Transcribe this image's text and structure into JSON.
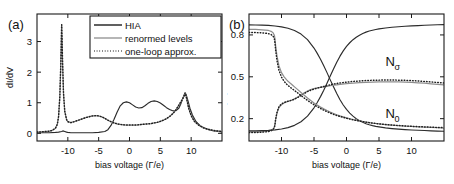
{
  "figure": {
    "panel_a_tag": "(a)",
    "panel_b_tag": "(b)"
  },
  "legend": {
    "position": "top-center-right",
    "items": [
      {
        "label": "HIA",
        "style": "solid",
        "color": "#2b2b2b"
      },
      {
        "label": "renormed levels",
        "style": "thin-solid",
        "color": "#8e8e8e"
      },
      {
        "label": "one-loop approx.",
        "style": "dotted",
        "color": "#1f1f1f"
      }
    ]
  },
  "chart_data": [
    {
      "type": "line",
      "panel": "(a)",
      "title": "",
      "xlabel": "bias voltage (Γ/e)",
      "ylabel": "dI/dV",
      "xlim": [
        -15,
        15
      ],
      "ylim": [
        -0.25,
        3.9
      ],
      "xticks": [
        -10,
        -5,
        0,
        5,
        10
      ],
      "xticklabels": [
        "-10",
        "-5",
        "0",
        "5",
        "10"
      ],
      "yticks": [
        0,
        1,
        2,
        3
      ],
      "yticklabels": [
        "0",
        "1",
        "2",
        "3"
      ],
      "grid": false,
      "series": [
        {
          "name": "HIA",
          "style": "solid",
          "color": "#2b2b2b",
          "x": [
            -15,
            -14,
            -13,
            -12,
            -11.5,
            -11,
            -10.8,
            -10.5,
            -10.2,
            -10,
            -9.5,
            -9,
            -8,
            -7,
            -6,
            -5,
            -4,
            -3.5,
            -3,
            -2.5,
            -2,
            -1.5,
            -1,
            -0.5,
            0,
            0.5,
            1,
            1.5,
            2,
            2.5,
            3,
            3.5,
            4,
            4.5,
            5,
            5.5,
            6,
            6.5,
            7,
            7.5,
            8,
            8.3,
            8.6,
            8.9,
            9,
            9.2,
            9.5,
            9.8,
            10.2,
            10.8,
            11.5,
            12.5,
            13.5,
            15
          ],
          "y": [
            0.02,
            0.02,
            0.02,
            0.03,
            0.04,
            0.06,
            0.08,
            0.06,
            0.04,
            0.03,
            0.02,
            0.02,
            0.02,
            0.02,
            0.02,
            0.03,
            0.06,
            0.12,
            0.26,
            0.46,
            0.7,
            0.9,
            1.0,
            1.03,
            1.0,
            0.93,
            0.86,
            0.83,
            0.84,
            0.9,
            0.98,
            1.04,
            1.06,
            1.04,
            0.99,
            0.92,
            0.84,
            0.78,
            0.74,
            0.74,
            0.82,
            0.95,
            1.12,
            1.28,
            1.33,
            1.26,
            1.05,
            0.82,
            0.6,
            0.38,
            0.24,
            0.14,
            0.09,
            0.05
          ]
        },
        {
          "name": "renormed levels",
          "style": "thin-solid",
          "color": "#8e8e8e",
          "x": [
            -15,
            -13,
            -12.5,
            -12,
            -11.7,
            -11.5,
            -11.3,
            -11.15,
            -11.05,
            -11,
            -10.95,
            -10.85,
            -10.7,
            -10.5,
            -10.2,
            -10,
            -9.5,
            -9,
            -8,
            -7,
            -6,
            -5.5,
            -5,
            -4.5,
            -4,
            -3.5,
            -3,
            -2.5,
            -2,
            -1.5,
            -1,
            -0.5,
            0,
            0.5,
            1,
            1.5,
            2,
            2.5,
            3,
            3.5,
            4,
            4.5,
            5,
            5.5,
            6,
            6.5,
            7,
            7.5,
            8,
            8.3,
            8.6,
            8.8,
            8.95,
            9.05,
            9.15,
            9.3,
            9.6,
            10,
            10.5,
            11.2,
            12,
            13,
            14,
            15
          ],
          "y": [
            0.04,
            0.07,
            0.1,
            0.17,
            0.3,
            0.55,
            1.2,
            2.2,
            3.1,
            3.55,
            3.2,
            2.3,
            1.3,
            0.72,
            0.45,
            0.38,
            0.35,
            0.38,
            0.45,
            0.52,
            0.57,
            0.58,
            0.57,
            0.54,
            0.49,
            0.43,
            0.38,
            0.34,
            0.31,
            0.29,
            0.28,
            0.27,
            0.27,
            0.27,
            0.27,
            0.28,
            0.29,
            0.3,
            0.31,
            0.32,
            0.34,
            0.36,
            0.39,
            0.43,
            0.48,
            0.55,
            0.64,
            0.76,
            0.92,
            1.02,
            1.12,
            1.2,
            1.26,
            1.28,
            1.24,
            1.1,
            0.82,
            0.58,
            0.4,
            0.27,
            0.18,
            0.12,
            0.08,
            0.06
          ]
        },
        {
          "name": "one-loop approx.",
          "style": "dotted",
          "color": "#1f1f1f",
          "x": [
            -15,
            -13,
            -12.5,
            -12,
            -11.7,
            -11.5,
            -11.3,
            -11.15,
            -11.05,
            -11,
            -10.95,
            -10.85,
            -10.7,
            -10.5,
            -10.2,
            -10,
            -9.5,
            -9,
            -8,
            -7,
            -6,
            -5.5,
            -5,
            -4.5,
            -4,
            -3.5,
            -3,
            -2.5,
            -2,
            -1.5,
            -1,
            -0.5,
            0,
            0.5,
            1,
            1.5,
            2,
            2.5,
            3,
            3.5,
            4,
            4.5,
            5,
            5.5,
            6,
            6.5,
            7,
            7.5,
            8,
            8.3,
            8.6,
            8.8,
            8.95,
            9.05,
            9.15,
            9.3,
            9.6,
            10,
            10.5,
            11.2,
            12,
            13,
            14,
            15
          ],
          "y": [
            0.04,
            0.07,
            0.1,
            0.17,
            0.3,
            0.55,
            1.2,
            2.2,
            3.1,
            3.55,
            3.2,
            2.3,
            1.3,
            0.72,
            0.45,
            0.38,
            0.35,
            0.38,
            0.45,
            0.52,
            0.57,
            0.58,
            0.57,
            0.54,
            0.49,
            0.43,
            0.38,
            0.34,
            0.31,
            0.29,
            0.28,
            0.27,
            0.27,
            0.27,
            0.27,
            0.28,
            0.29,
            0.3,
            0.31,
            0.32,
            0.34,
            0.36,
            0.39,
            0.43,
            0.48,
            0.55,
            0.64,
            0.76,
            0.92,
            1.02,
            1.12,
            1.2,
            1.26,
            1.28,
            1.24,
            1.1,
            0.82,
            0.58,
            0.4,
            0.27,
            0.18,
            0.12,
            0.08,
            0.06
          ]
        }
      ]
    },
    {
      "type": "line",
      "panel": "(b)",
      "title": "",
      "xlabel": "bias voltage (Γ/e)",
      "ylabel": "pop. numbers",
      "xlim": [
        -15,
        15
      ],
      "ylim": [
        0.04,
        0.95
      ],
      "xticks": [
        -10,
        -5,
        0,
        5,
        10
      ],
      "xticklabels": [
        "-10",
        "-5",
        "0",
        "5",
        "10"
      ],
      "yticks": [
        0.2,
        0.5,
        0.8
      ],
      "yticklabels": [
        "0.2",
        "0.5",
        "0.8"
      ],
      "grid": false,
      "annotations": [
        {
          "text": "N",
          "sub": "σ",
          "x": 6.0,
          "y": 0.575
        },
        {
          "text": "N",
          "sub": "0",
          "x": 6.0,
          "y": 0.205
        }
      ],
      "series": [
        {
          "name": "N_sigma HIA",
          "style": "solid",
          "color": "#2b2b2b",
          "x": [
            -15,
            -14,
            -13,
            -12,
            -11,
            -10,
            -9,
            -8,
            -7,
            -6,
            -5,
            -4.5,
            -4,
            -3.5,
            -3,
            -2.5,
            -2,
            -1.5,
            -1,
            -0.5,
            0,
            0.5,
            1,
            1.5,
            2,
            2.5,
            3,
            3.5,
            4,
            4.5,
            5,
            6,
            7,
            8,
            9,
            10,
            11,
            12,
            13,
            14,
            15
          ],
          "y": [
            0.872,
            0.871,
            0.87,
            0.868,
            0.864,
            0.858,
            0.848,
            0.832,
            0.806,
            0.766,
            0.706,
            0.668,
            0.626,
            0.58,
            0.53,
            0.478,
            0.428,
            0.38,
            0.336,
            0.298,
            0.266,
            0.24,
            0.218,
            0.2,
            0.186,
            0.174,
            0.164,
            0.156,
            0.15,
            0.145,
            0.141,
            0.134,
            0.129,
            0.125,
            0.122,
            0.119,
            0.117,
            0.115,
            0.113,
            0.111,
            0.11
          ]
        },
        {
          "name": "N_sigma renorm",
          "style": "thin-solid",
          "color": "#8e8e8e",
          "x": [
            -15,
            -14,
            -13,
            -12.5,
            -12,
            -11.6,
            -11.3,
            -11.1,
            -11,
            -10.9,
            -10.7,
            -10.4,
            -10,
            -9.6,
            -9.2,
            -9,
            -8.6,
            -8.2,
            -8,
            -7.5,
            -7,
            -6.5,
            -6,
            -5.5,
            -5,
            -4.5,
            -4,
            -3.5,
            -3,
            -2.5,
            -2,
            -1.5,
            -1,
            0,
            1,
            2,
            3,
            4,
            5,
            6,
            7,
            8,
            9,
            10,
            11,
            12,
            13,
            14,
            15
          ],
          "y": [
            0.105,
            0.106,
            0.108,
            0.11,
            0.113,
            0.118,
            0.126,
            0.14,
            0.16,
            0.195,
            0.24,
            0.28,
            0.3,
            0.312,
            0.32,
            0.324,
            0.33,
            0.337,
            0.342,
            0.355,
            0.37,
            0.385,
            0.398,
            0.408,
            0.415,
            0.42,
            0.424,
            0.428,
            0.432,
            0.436,
            0.44,
            0.443,
            0.446,
            0.451,
            0.455,
            0.458,
            0.46,
            0.462,
            0.463,
            0.464,
            0.464,
            0.463,
            0.462,
            0.46,
            0.457,
            0.454,
            0.45,
            0.446,
            0.443
          ]
        },
        {
          "name": "N_sigma one-loop",
          "style": "dotted",
          "color": "#1f1f1f",
          "x": [
            -15,
            -14,
            -13,
            -12.5,
            -12,
            -11.6,
            -11.3,
            -11.1,
            -11,
            -10.9,
            -10.7,
            -10.4,
            -10,
            -9.6,
            -9.2,
            -9,
            -8.6,
            -8.2,
            -8,
            -7.5,
            -7,
            -6.5,
            -6,
            -5.5,
            -5,
            -4.5,
            -4,
            -3.5,
            -3,
            -2.5,
            -2,
            -1.5,
            -1,
            0,
            1,
            2,
            3,
            4,
            5,
            6,
            7,
            8,
            9,
            10,
            11,
            12,
            13,
            14,
            15
          ],
          "y": [
            0.1,
            0.101,
            0.103,
            0.105,
            0.108,
            0.113,
            0.121,
            0.136,
            0.158,
            0.196,
            0.244,
            0.286,
            0.306,
            0.316,
            0.322,
            0.325,
            0.33,
            0.336,
            0.34,
            0.352,
            0.366,
            0.38,
            0.394,
            0.404,
            0.412,
            0.419,
            0.425,
            0.431,
            0.437,
            0.443,
            0.448,
            0.452,
            0.456,
            0.462,
            0.467,
            0.47,
            0.473,
            0.475,
            0.476,
            0.477,
            0.477,
            0.476,
            0.475,
            0.473,
            0.47,
            0.467,
            0.463,
            0.459,
            0.456
          ]
        },
        {
          "name": "N_0 HIA",
          "style": "solid",
          "color": "#2b2b2b",
          "x": [
            -15,
            -14,
            -13,
            -12,
            -11,
            -10,
            -9,
            -8,
            -7,
            -6,
            -5,
            -4.5,
            -4,
            -3.5,
            -3,
            -2.5,
            -2,
            -1.5,
            -1,
            -0.5,
            0,
            0.5,
            1,
            1.5,
            2,
            2.5,
            3,
            3.5,
            4,
            4.5,
            5,
            6,
            7,
            8,
            9,
            10,
            11,
            12,
            13,
            14,
            15
          ],
          "y": [
            0.112,
            0.113,
            0.114,
            0.116,
            0.12,
            0.126,
            0.136,
            0.152,
            0.178,
            0.218,
            0.278,
            0.316,
            0.358,
            0.404,
            0.454,
            0.506,
            0.556,
            0.604,
            0.648,
            0.686,
            0.718,
            0.744,
            0.766,
            0.784,
            0.798,
            0.81,
            0.82,
            0.828,
            0.834,
            0.839,
            0.843,
            0.85,
            0.855,
            0.859,
            0.862,
            0.865,
            0.867,
            0.869,
            0.871,
            0.873,
            0.874
          ]
        },
        {
          "name": "N_0 renorm",
          "style": "thin-solid",
          "color": "#8e8e8e",
          "x": [
            -15,
            -14,
            -13,
            -12.5,
            -12,
            -11.6,
            -11.3,
            -11.1,
            -11,
            -10.9,
            -10.7,
            -10.4,
            -10,
            -9.6,
            -9.2,
            -9,
            -8.6,
            -8.2,
            -8,
            -7.5,
            -7,
            -6.5,
            -6,
            -5.5,
            -5,
            -4.5,
            -4,
            -3.5,
            -3,
            -2.5,
            -2,
            -1.5,
            -1,
            0,
            1,
            2,
            3,
            4,
            5,
            6,
            7,
            8,
            9,
            10,
            11,
            12,
            13,
            14,
            15
          ],
          "y": [
            0.84,
            0.839,
            0.837,
            0.835,
            0.832,
            0.826,
            0.816,
            0.798,
            0.77,
            0.72,
            0.65,
            0.58,
            0.53,
            0.5,
            0.478,
            0.468,
            0.452,
            0.436,
            0.428,
            0.408,
            0.388,
            0.368,
            0.348,
            0.33,
            0.313,
            0.297,
            0.283,
            0.27,
            0.258,
            0.247,
            0.237,
            0.228,
            0.22,
            0.206,
            0.194,
            0.184,
            0.176,
            0.169,
            0.163,
            0.158,
            0.154,
            0.15,
            0.147,
            0.144,
            0.141,
            0.139,
            0.137,
            0.135,
            0.133
          ]
        },
        {
          "name": "N_0 one-loop",
          "style": "dotted",
          "color": "#1f1f1f",
          "x": [
            -15,
            -14,
            -13,
            -12.5,
            -12,
            -11.6,
            -11.3,
            -11.1,
            -11,
            -10.9,
            -10.7,
            -10.4,
            -10,
            -9.6,
            -9.2,
            -9,
            -8.6,
            -8.2,
            -8,
            -7.5,
            -7,
            -6.5,
            -6,
            -5.5,
            -5,
            -4.5,
            -4,
            -3.5,
            -3,
            -2.5,
            -2,
            -1.5,
            -1,
            0,
            1,
            2,
            3,
            4,
            5,
            6,
            7,
            8,
            9,
            10,
            11,
            12,
            13,
            14,
            15
          ],
          "y": [
            0.818,
            0.817,
            0.815,
            0.813,
            0.809,
            0.803,
            0.792,
            0.773,
            0.742,
            0.69,
            0.618,
            0.548,
            0.498,
            0.468,
            0.447,
            0.438,
            0.423,
            0.409,
            0.402,
            0.384,
            0.366,
            0.348,
            0.331,
            0.315,
            0.3,
            0.286,
            0.273,
            0.261,
            0.25,
            0.24,
            0.231,
            0.223,
            0.216,
            0.203,
            0.192,
            0.183,
            0.175,
            0.168,
            0.163,
            0.158,
            0.154,
            0.151,
            0.148,
            0.145,
            0.143,
            0.141,
            0.139,
            0.137,
            0.136
          ]
        }
      ]
    }
  ]
}
